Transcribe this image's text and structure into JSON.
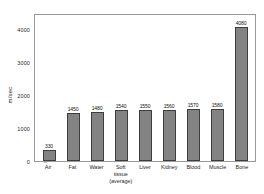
{
  "chart_data": {
    "type": "bar",
    "title": "",
    "xlabel": "",
    "ylabel": "m/sec",
    "ylim": [
      0,
      4500
    ],
    "grid": false,
    "legend": false,
    "yticks": [
      0,
      1000,
      2000,
      3000,
      4000
    ],
    "ytick_labels": [
      "0",
      "1000",
      "2000",
      "3000",
      "4000"
    ],
    "categories": [
      "Air",
      "Fat",
      "Water",
      "Soft tissue (average)",
      "Liver",
      "Kidney",
      "Blood",
      "Muscle",
      "Bone"
    ],
    "category_lines": [
      [
        "Air",
        ""
      ],
      [
        "Fat",
        ""
      ],
      [
        "Water",
        ""
      ],
      [
        "Soft tissue",
        "(average)"
      ],
      [
        "Liver",
        ""
      ],
      [
        "Kidney",
        ""
      ],
      [
        "Blood",
        ""
      ],
      [
        "Muscle",
        ""
      ],
      [
        "Bone",
        ""
      ]
    ],
    "values": [
      330,
      1450,
      1480,
      1540,
      1550,
      1560,
      1570,
      1580,
      4080
    ],
    "value_labels": [
      "330",
      "1450",
      "1480",
      "1540",
      "1550",
      "1560",
      "1570",
      "1580",
      "4080"
    ],
    "colors": {
      "bar_fill": "#838383",
      "bar_edge": "#3d3d3d",
      "axis": "#9a9a9a",
      "text": "#1f1f1f",
      "background": "#ffffff"
    }
  }
}
